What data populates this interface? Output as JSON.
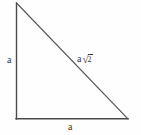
{
  "figure": {
    "background_color": "#fefefe",
    "stroke_color": "#4a4a4a",
    "text_color": "#3a3a3a"
  },
  "geometry": {
    "type": "right-triangle",
    "vertices": {
      "top_left": {
        "x": 16,
        "y": 3
      },
      "bottom_left": {
        "x": 16,
        "y": 119
      },
      "bottom_right": {
        "x": 128,
        "y": 119
      }
    },
    "right_angle_at": "bottom_left"
  },
  "labels": {
    "vertical_leg": "a",
    "horizontal_leg": "a",
    "hypotenuse": {
      "coefficient": "a",
      "radical_sign": "√",
      "radicand": "2",
      "full_text": "a √2"
    }
  }
}
